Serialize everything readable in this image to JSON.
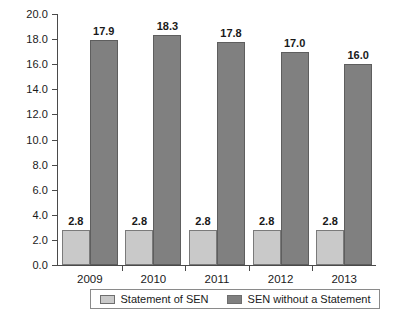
{
  "chart_data": {
    "type": "bar",
    "title": "",
    "xlabel": "",
    "ylabel": "",
    "ylim": [
      0.0,
      20.0
    ],
    "ytick_step": 2.0,
    "ytick_labels": [
      "0.0",
      "2.0",
      "4.0",
      "6.0",
      "8.0",
      "10.0",
      "12.0",
      "14.0",
      "16.0",
      "18.0",
      "20.0"
    ],
    "grid": false,
    "legend_position": "bottom",
    "categories": [
      "2009",
      "2010",
      "2011",
      "2012",
      "2013"
    ],
    "series": [
      {
        "name": "Statement of SEN",
        "color": "#c9c9c9",
        "values": [
          2.8,
          2.8,
          2.8,
          2.8,
          2.8
        ],
        "labels": [
          "2.8",
          "2.8",
          "2.8",
          "2.8",
          "2.8"
        ]
      },
      {
        "name": "SEN without a Statement",
        "color": "#808080",
        "values": [
          17.9,
          18.3,
          17.8,
          17.0,
          16.0
        ],
        "labels": [
          "17.9",
          "18.3",
          "17.8",
          "17.0",
          "16.0"
        ]
      }
    ]
  },
  "legend": {
    "items": [
      {
        "label": "Statement of SEN",
        "swatch": "light"
      },
      {
        "label": "SEN without a Statement",
        "swatch": "dark"
      }
    ]
  }
}
